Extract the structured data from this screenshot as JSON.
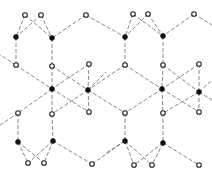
{
  "diagram": {
    "title": "",
    "kind": "lattice network",
    "colors": {
      "edge": "#6a6a6a",
      "open_node_fill": "#ffffff",
      "open_node_stroke": "#222222",
      "filled_node": "#111111"
    },
    "nodes": [
      {
        "id": "t1",
        "x": 25,
        "y": 15,
        "type": "open"
      },
      {
        "id": "t2",
        "x": 41,
        "y": 15,
        "type": "open"
      },
      {
        "id": "t3",
        "x": 86,
        "y": 15,
        "type": "open"
      },
      {
        "id": "t4",
        "x": 133,
        "y": 14,
        "type": "open"
      },
      {
        "id": "t5",
        "x": 148,
        "y": 14,
        "type": "open"
      },
      {
        "id": "t6",
        "x": 194,
        "y": 14,
        "type": "open"
      },
      {
        "id": "f1",
        "x": 16,
        "y": 37,
        "type": "filled"
      },
      {
        "id": "f2",
        "x": 52,
        "y": 38,
        "type": "filled"
      },
      {
        "id": "f3",
        "x": 125,
        "y": 37,
        "type": "filled"
      },
      {
        "id": "f4",
        "x": 163,
        "y": 36,
        "type": "filled"
      },
      {
        "id": "o1",
        "x": 16,
        "y": 65,
        "type": "open"
      },
      {
        "id": "o2",
        "x": 52,
        "y": 66,
        "type": "open"
      },
      {
        "id": "o3",
        "x": 89,
        "y": 64,
        "type": "open"
      },
      {
        "id": "o4",
        "x": 125,
        "y": 65,
        "type": "open"
      },
      {
        "id": "o5",
        "x": 163,
        "y": 65,
        "type": "open"
      },
      {
        "id": "o6",
        "x": 199,
        "y": 64,
        "type": "open"
      },
      {
        "id": "m1",
        "x": 52,
        "y": 89,
        "type": "filled"
      },
      {
        "id": "m2",
        "x": 88,
        "y": 90,
        "type": "filled"
      },
      {
        "id": "m3",
        "x": 162,
        "y": 89,
        "type": "filled"
      },
      {
        "id": "m4",
        "x": 199,
        "y": 92,
        "type": "filled"
      },
      {
        "id": "p1",
        "x": 18,
        "y": 113,
        "type": "open"
      },
      {
        "id": "p2",
        "x": 52,
        "y": 114,
        "type": "open"
      },
      {
        "id": "p3",
        "x": 89,
        "y": 112,
        "type": "open"
      },
      {
        "id": "p4",
        "x": 125,
        "y": 113,
        "type": "open"
      },
      {
        "id": "p5",
        "x": 163,
        "y": 113,
        "type": "open"
      },
      {
        "id": "p6",
        "x": 199,
        "y": 112,
        "type": "open"
      },
      {
        "id": "b1",
        "x": 18,
        "y": 142,
        "type": "filled"
      },
      {
        "id": "b2",
        "x": 53,
        "y": 141,
        "type": "filled"
      },
      {
        "id": "b3",
        "x": 125,
        "y": 141,
        "type": "filled"
      },
      {
        "id": "b4",
        "x": 163,
        "y": 143,
        "type": "filled"
      },
      {
        "id": "u1",
        "x": 28,
        "y": 163,
        "type": "open"
      },
      {
        "id": "u2",
        "x": 44,
        "y": 163,
        "type": "open"
      },
      {
        "id": "u3",
        "x": 92,
        "y": 164,
        "type": "open"
      },
      {
        "id": "u4",
        "x": 134,
        "y": 165,
        "type": "open"
      },
      {
        "id": "u5",
        "x": 152,
        "y": 165,
        "type": "open"
      },
      {
        "id": "u6",
        "x": 199,
        "y": 165,
        "type": "open"
      }
    ],
    "edges": [
      [
        "t1",
        "f1"
      ],
      [
        "t1",
        "f2"
      ],
      [
        "t2",
        "f1"
      ],
      [
        "t2",
        "f2"
      ],
      [
        "t3",
        "f2"
      ],
      [
        "t3",
        "f3"
      ],
      [
        "t4",
        "f3"
      ],
      [
        "t4",
        "f4"
      ],
      [
        "t5",
        "f3"
      ],
      [
        "t5",
        "f4"
      ],
      [
        "t6",
        "f4"
      ],
      [
        "t6",
        "x:212,y:25"
      ],
      [
        "f1",
        "o1"
      ],
      [
        "f2",
        "o2"
      ],
      [
        "f3",
        "o4"
      ],
      [
        "f4",
        "o5"
      ],
      [
        "o1",
        "m1"
      ],
      [
        "o2",
        "m1"
      ],
      [
        "o3",
        "m1"
      ],
      [
        "o2",
        "m2"
      ],
      [
        "o3",
        "m2"
      ],
      [
        "o4",
        "m2"
      ],
      [
        "o4",
        "m3"
      ],
      [
        "o5",
        "m3"
      ],
      [
        "o6",
        "m3"
      ],
      [
        "o5",
        "m4"
      ],
      [
        "o6",
        "m4"
      ],
      [
        "m1",
        "p1"
      ],
      [
        "m1",
        "p2"
      ],
      [
        "m1",
        "p3"
      ],
      [
        "m2",
        "p2"
      ],
      [
        "m2",
        "p3"
      ],
      [
        "m2",
        "p4"
      ],
      [
        "m3",
        "p4"
      ],
      [
        "m3",
        "p5"
      ],
      [
        "m3",
        "p6"
      ],
      [
        "m4",
        "p5"
      ],
      [
        "m4",
        "p6"
      ],
      [
        "o1",
        "x:0,y:55"
      ],
      [
        "p1",
        "x:0,y:125"
      ],
      [
        "m2",
        "x:106,y:72"
      ],
      [
        "m4",
        "x:212,y:80"
      ],
      [
        "m4",
        "x:212,y:100"
      ],
      [
        "p1",
        "b1"
      ],
      [
        "p2",
        "b2"
      ],
      [
        "p4",
        "b3"
      ],
      [
        "p5",
        "b4"
      ],
      [
        "b1",
        "u1"
      ],
      [
        "b1",
        "u2"
      ],
      [
        "b2",
        "u1"
      ],
      [
        "b2",
        "u2"
      ],
      [
        "b2",
        "u3"
      ],
      [
        "b3",
        "u3"
      ],
      [
        "b3",
        "u4"
      ],
      [
        "b3",
        "u5"
      ],
      [
        "b4",
        "u4"
      ],
      [
        "b4",
        "u5"
      ],
      [
        "b4",
        "u6"
      ],
      [
        "b3",
        "x:106,y:153"
      ]
    ]
  }
}
